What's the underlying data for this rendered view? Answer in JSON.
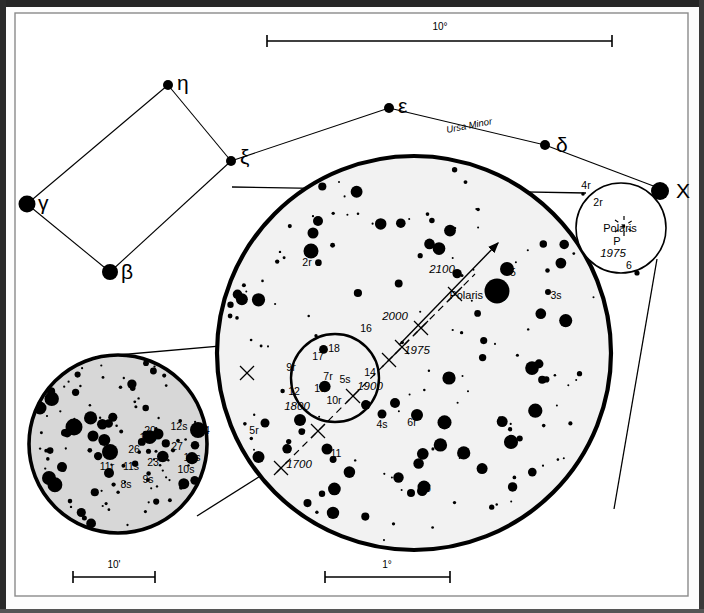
{
  "figure": {
    "kind": "astronomical-finder-chart",
    "subject": "Polaris",
    "constellation_label": "Ursa Minor"
  },
  "scales": [
    {
      "id": "top",
      "label": "10°",
      "x1": 267,
      "x2": 612,
      "y": 41,
      "text_x": 440,
      "text_y": 30
    },
    {
      "id": "bottom-left",
      "label": "10'",
      "x1": 73,
      "x2": 155,
      "y": 577,
      "text_x": 114,
      "text_y": 568
    },
    {
      "id": "bottom-right",
      "label": "1°",
      "x1": 325,
      "x2": 450,
      "y": 577,
      "text_x": 387,
      "text_y": 568
    }
  ],
  "constellation": {
    "name": "Ursa Minor",
    "name_pos": {
      "x": 447,
      "y": 133,
      "rotate": -11
    },
    "stars": [
      {
        "label": "η",
        "x": 168,
        "y": 85,
        "r": 5.0,
        "lx": 177,
        "ly": 90
      },
      {
        "label": "ξ",
        "x": 231,
        "y": 161,
        "r": 5.0,
        "lx": 240,
        "ly": 164
      },
      {
        "label": "γ",
        "x": 27,
        "y": 204,
        "r": 8.5,
        "lx": 38,
        "ly": 210
      },
      {
        "label": "β",
        "x": 110,
        "y": 272,
        "r": 8.0,
        "lx": 121,
        "ly": 279
      },
      {
        "label": "ε",
        "x": 389,
        "y": 108,
        "r": 5.0,
        "lx": 398,
        "ly": 113
      },
      {
        "label": "δ",
        "x": 545,
        "y": 145,
        "r": 5.0,
        "lx": 556,
        "ly": 152
      },
      {
        "label": "X",
        "x": 664,
        "y": 190,
        "r": 9.0,
        "lx": 676,
        "ly": 198
      }
    ],
    "lines": [
      [
        168,
        85,
        231,
        161
      ],
      [
        168,
        85,
        27,
        204
      ],
      [
        27,
        204,
        110,
        272
      ],
      [
        110,
        272,
        231,
        161
      ],
      [
        231,
        161,
        389,
        108
      ],
      [
        389,
        108,
        545,
        145
      ],
      [
        545,
        145,
        664,
        190
      ]
    ]
  },
  "polaris_inset": {
    "circle": {
      "cx": 621,
      "cy": 228,
      "r": 45
    },
    "labels": [
      {
        "text": "4r",
        "x": 586,
        "y": 189,
        "cls": "starnum"
      },
      {
        "text": "2r",
        "x": 598,
        "y": 206,
        "cls": "starnum"
      },
      {
        "text": "Polaris",
        "x": 620,
        "y": 232,
        "cls": "namelbl"
      },
      {
        "text": "P",
        "x": 617,
        "y": 245,
        "cls": "namelbl"
      },
      {
        "text": "1975",
        "x": 613,
        "y": 257,
        "cls": "yr"
      },
      {
        "text": "6",
        "x": 629,
        "y": 269,
        "cls": "starnum"
      }
    ],
    "pole_mark": {
      "x": 624,
      "y": 226
    },
    "stars": [
      {
        "x": 583,
        "y": 194,
        "r": 1.8
      },
      {
        "x": 660,
        "y": 191,
        "r": 9.0
      },
      {
        "x": 637,
        "y": 273,
        "r": 2.6
      }
    ]
  },
  "main_circle": {
    "cx": 414,
    "cy": 353,
    "r": 197,
    "fill": "#f2f2f2",
    "arrow": {
      "x1": 399,
      "y1": 345,
      "x2": 498,
      "y2": 243
    },
    "labels": [
      {
        "text": "2r",
        "x": 307,
        "y": 266,
        "cls": "starnum"
      },
      {
        "text": "5",
        "x": 513,
        "y": 276,
        "cls": "starnum"
      },
      {
        "text": "1s",
        "x": 500,
        "y": 301,
        "cls": "starnum"
      },
      {
        "text": "Polaris",
        "x": 483,
        "y": 299,
        "cls": "namelbl",
        "anchor": "end"
      },
      {
        "text": "3s",
        "x": 556,
        "y": 299,
        "cls": "starnum"
      },
      {
        "text": "2100",
        "x": 442,
        "y": 273,
        "cls": "yr"
      },
      {
        "text": "2000",
        "x": 395,
        "y": 320,
        "cls": "yr"
      },
      {
        "text": "1975",
        "x": 417,
        "y": 354,
        "cls": "yr"
      },
      {
        "text": "1900",
        "x": 370,
        "y": 390,
        "cls": "yr"
      },
      {
        "text": "1800",
        "x": 297,
        "y": 410,
        "cls": "yr"
      },
      {
        "text": "1700",
        "x": 299,
        "y": 468,
        "cls": "yr"
      },
      {
        "text": "16",
        "x": 366,
        "y": 332,
        "cls": "starnum"
      },
      {
        "text": "18",
        "x": 334,
        "y": 352,
        "cls": "starnum"
      },
      {
        "text": "17",
        "x": 318,
        "y": 360,
        "cls": "starnum"
      },
      {
        "text": "9r",
        "x": 291,
        "y": 371,
        "cls": "starnum"
      },
      {
        "text": "7r",
        "x": 328,
        "y": 380,
        "cls": "starnum"
      },
      {
        "text": "5s",
        "x": 345,
        "y": 383,
        "cls": "starnum"
      },
      {
        "text": "14",
        "x": 370,
        "y": 376,
        "cls": "starnum"
      },
      {
        "text": "13",
        "x": 320,
        "y": 392,
        "cls": "starnum"
      },
      {
        "text": "12",
        "x": 294,
        "y": 395,
        "cls": "starnum"
      },
      {
        "text": "10r",
        "x": 334,
        "y": 404,
        "cls": "starnum"
      },
      {
        "text": "5r",
        "x": 254,
        "y": 434,
        "cls": "starnum"
      },
      {
        "text": "11",
        "x": 336,
        "y": 457,
        "cls": "starnum"
      },
      {
        "text": "4s",
        "x": 382,
        "y": 428,
        "cls": "starnum"
      },
      {
        "text": "6r",
        "x": 412,
        "y": 426,
        "cls": "starnum"
      },
      {
        "text": "6",
        "x": 428,
        "y": 492,
        "cls": "starnum"
      }
    ],
    "pm_track": [
      [
        277,
        472
      ],
      [
        300,
        449
      ],
      [
        325,
        424
      ],
      [
        350,
        399
      ],
      [
        375,
        374
      ],
      [
        400,
        349
      ],
      [
        425,
        324
      ],
      [
        450,
        299
      ],
      [
        475,
        274
      ]
    ],
    "pm_ticks": [
      {
        "x": 281,
        "y": 468
      },
      {
        "x": 318,
        "y": 431
      },
      {
        "x": 353,
        "y": 396
      },
      {
        "x": 389,
        "y": 360
      },
      {
        "x": 402,
        "y": 347
      },
      {
        "x": 421,
        "y": 328
      },
      {
        "x": 455,
        "y": 294
      },
      {
        "x": 247,
        "y": 373
      },
      {
        "x": 91,
        "y": 464
      }
    ]
  },
  "inner_circle": {
    "cx": 335,
    "cy": 378,
    "r": 44
  },
  "magnified_circle": {
    "cx": 118,
    "cy": 444,
    "r": 89,
    "fill": "#d7d7d7",
    "labels": [
      {
        "text": "20",
        "x": 150,
        "y": 434,
        "cls": "starnum"
      },
      {
        "text": "12s",
        "x": 179,
        "y": 430,
        "cls": "starnum"
      },
      {
        "text": "14",
        "x": 204,
        "y": 434,
        "cls": "starnum"
      },
      {
        "text": "16s",
        "x": 148,
        "y": 441,
        "cls": "starnum"
      },
      {
        "text": "27",
        "x": 177,
        "y": 450,
        "cls": "starnum"
      },
      {
        "text": "26",
        "x": 134,
        "y": 453,
        "cls": "starnum"
      },
      {
        "text": "13s",
        "x": 192,
        "y": 461,
        "cls": "starnum"
      },
      {
        "text": "11r",
        "x": 107,
        "y": 470,
        "cls": "starnum"
      },
      {
        "text": "11s",
        "x": 131,
        "y": 470,
        "cls": "starnum"
      },
      {
        "text": "23",
        "x": 153,
        "y": 466,
        "cls": "starnum"
      },
      {
        "text": "10s",
        "x": 186,
        "y": 473,
        "cls": "starnum"
      },
      {
        "text": "8s",
        "x": 126,
        "y": 488,
        "cls": "starnum"
      },
      {
        "text": "9s",
        "x": 148,
        "y": 483,
        "cls": "starnum"
      }
    ]
  },
  "cones": {
    "inset_to_main": [
      [
        586,
        193,
        232,
        187
      ],
      [
        657,
        259,
        614,
        509
      ]
    ],
    "inner_to_magnified": [
      [
        95,
        357,
        347,
        335
      ],
      [
        197,
        516,
        363,
        411
      ]
    ]
  }
}
